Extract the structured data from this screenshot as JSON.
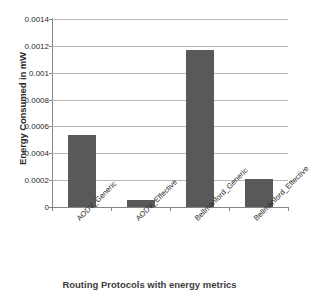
{
  "chart_data": {
    "type": "bar",
    "title": "",
    "xlabel": "Routing Protocols with energy metrics",
    "ylabel": "Energy Consumed in mW",
    "categories": [
      "AODV_Generic",
      "AODV_Effective",
      "Bellmanford_Generic",
      "Bellmanford_Effective"
    ],
    "values": [
      0.00054,
      5e-05,
      0.00117,
      0.00021
    ],
    "ylim": [
      0,
      0.0014
    ],
    "ytick_labels": [
      "0",
      "0.0002",
      "0.0004",
      "0.0006",
      "0.0008",
      "0.001",
      "0.0012",
      "0.0014"
    ],
    "ytick_values": [
      0,
      0.0002,
      0.0004,
      0.0006,
      0.0008,
      0.001,
      0.0012,
      0.0014
    ],
    "grid": true,
    "legend": false,
    "bar_color": "#595959",
    "gridline_color": "#b7b7b7",
    "axis_color": "#868686",
    "background_color": "#ffffff"
  }
}
